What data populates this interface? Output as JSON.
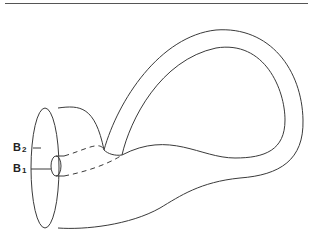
{
  "diagram": {
    "type": "Klein bottle illustration",
    "labels": [
      {
        "id": "B2",
        "text": "B",
        "subscript": "2"
      },
      {
        "id": "B1",
        "text": "B",
        "subscript": "1"
      }
    ],
    "colors": {
      "stroke": "#3a3a3a",
      "background": "#ffffff"
    }
  }
}
